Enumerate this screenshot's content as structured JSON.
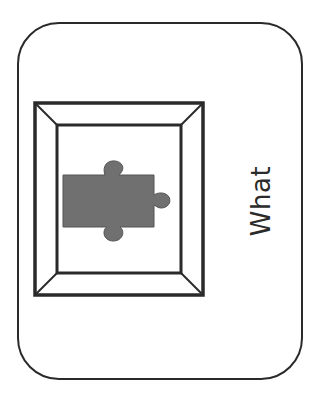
{
  "card": {
    "label": "What",
    "icon": "puzzle-piece-in-frame",
    "colors": {
      "border": "#2a2a2a",
      "puzzle_fill": "#707070",
      "background": "#ffffff"
    }
  }
}
